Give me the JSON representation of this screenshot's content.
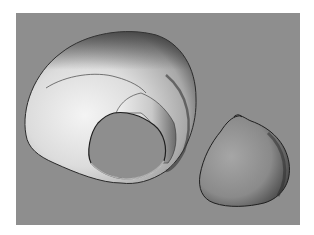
{
  "scene": {
    "description": "3D surface rendering of a skull with a craniotomy defect and the separated bone flap",
    "background_color": "#8e8e8e",
    "border_color": "#ffffff"
  },
  "objects": [
    {
      "name": "skull-with-defect",
      "shading": "light grey, brightly lit from left"
    },
    {
      "name": "bone-flap",
      "shading": "medium grey, darker on right edge"
    }
  ]
}
